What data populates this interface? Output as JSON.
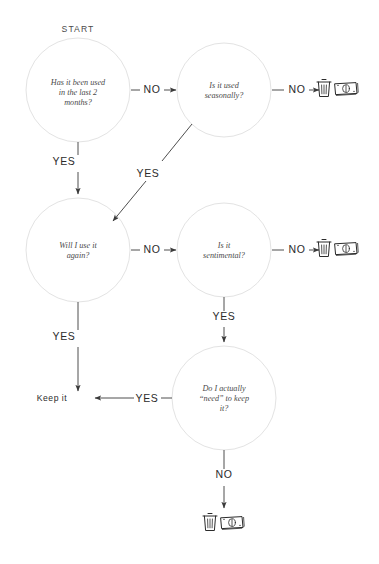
{
  "diagram": {
    "start_label": "START",
    "colors": {
      "background": "#ffffff",
      "circle_stroke": "#e3e3e3",
      "arrow": "#3a3a3a",
      "node_text": "#4a4a4a",
      "label_text": "#2b2b2b"
    },
    "nodes": [
      {
        "id": "q1",
        "kind": "decision",
        "lines": [
          "Has it been used",
          "in the last 2",
          "months?"
        ],
        "cx": 78,
        "cy": 90,
        "r": 52
      },
      {
        "id": "q2",
        "kind": "decision",
        "lines": [
          "Is it used",
          "seasonally?"
        ],
        "cx": 224,
        "cy": 90,
        "r": 47
      },
      {
        "id": "q3",
        "kind": "decision",
        "lines": [
          "Will I use it",
          "again?"
        ],
        "cx": 78,
        "cy": 250,
        "r": 52
      },
      {
        "id": "q4",
        "kind": "decision",
        "lines": [
          "Is it",
          "sentimental?"
        ],
        "cx": 224,
        "cy": 250,
        "r": 47
      },
      {
        "id": "q5",
        "kind": "decision",
        "lines": [
          "Do I actually",
          "“need” to keep",
          "it?"
        ],
        "cx": 224,
        "cy": 398,
        "r": 52
      }
    ],
    "terminals": [
      {
        "id": "keep",
        "label": "Keep it",
        "x": 52,
        "y": 401
      }
    ],
    "edges": [
      {
        "id": "e1",
        "from": "q1",
        "to": "q2",
        "label": "NO",
        "label_x": 152,
        "label_y": 93
      },
      {
        "id": "e2",
        "from": "q2",
        "to": "discard-top",
        "label": "NO",
        "label_x": 297,
        "label_y": 93
      },
      {
        "id": "e3",
        "from": "q1",
        "to": "q3",
        "label": "YES",
        "label_x": 64,
        "label_y": 165
      },
      {
        "id": "e4",
        "from": "q2",
        "to": "q3",
        "label": "YES",
        "label_x": 148,
        "label_y": 177
      },
      {
        "id": "e5",
        "from": "q3",
        "to": "q4",
        "label": "NO",
        "label_x": 152,
        "label_y": 253
      },
      {
        "id": "e6",
        "from": "q4",
        "to": "discard-mid",
        "label": "NO",
        "label_x": 297,
        "label_y": 253
      },
      {
        "id": "e7",
        "from": "q4",
        "to": "q5",
        "label": "YES",
        "label_x": 224,
        "label_y": 320
      },
      {
        "id": "e8",
        "from": "q3",
        "to": "keep",
        "label": "YES",
        "label_x": 64,
        "label_y": 340
      },
      {
        "id": "e9",
        "from": "q5",
        "to": "keep",
        "label": "YES",
        "label_x": 147,
        "label_y": 404
      },
      {
        "id": "e10",
        "from": "q5",
        "to": "discard-bottom",
        "label": "NO",
        "label_x": 224,
        "label_y": 478
      }
    ],
    "outcome_icons": [
      {
        "id": "discard-top",
        "icons": [
          "trash-icon",
          "money-icon"
        ],
        "x": 324,
        "y": 88
      },
      {
        "id": "discard-mid",
        "icons": [
          "trash-icon",
          "money-icon"
        ],
        "x": 324,
        "y": 248
      },
      {
        "id": "discard-bottom",
        "icons": [
          "trash-icon",
          "money-icon"
        ],
        "x": 198,
        "y": 520
      }
    ]
  }
}
